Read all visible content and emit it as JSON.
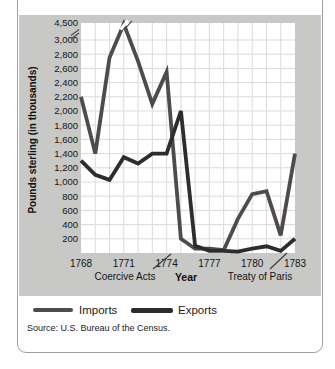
{
  "figure": {
    "source": "Source: U.S. Bureau of the Census.",
    "legend": [
      {
        "label": "Imports",
        "color": "#4f4b4d"
      },
      {
        "label": "Exports",
        "color": "#2f2c2d"
      }
    ]
  },
  "chart_data": {
    "type": "line",
    "title": "",
    "xlabel": "Year",
    "ylabel": "Pounds sterling (in thousands)",
    "x": [
      1768,
      1769,
      1770,
      1771,
      1772,
      1773,
      1774,
      1775,
      1776,
      1777,
      1778,
      1779,
      1780,
      1781,
      1782,
      1783
    ],
    "x_tick_labels": [
      "1768",
      "1771",
      "1774",
      "1777",
      "1780",
      "1783"
    ],
    "y_tick_labels": [
      "4,500",
      "3,000",
      "2,800",
      "2,600",
      "2,400",
      "2,200",
      "2,000",
      "1,800",
      "1,600",
      "1,400",
      "1,200",
      "1,000",
      "800",
      "600",
      "400",
      "200"
    ],
    "ylim": [
      0,
      4500
    ],
    "grid": true,
    "axis_break": {
      "axis": "y",
      "between": [
        3000,
        4500
      ],
      "note": "scale break between 3,000 and 4,500; peak line clipped with break marks"
    },
    "series": [
      {
        "name": "Imports",
        "color": "#4f4b4d",
        "values": [
          2200,
          1400,
          2750,
          4400,
          2700,
          2100,
          2550,
          200,
          60,
          60,
          40,
          480,
          830,
          870,
          250,
          1400
        ]
      },
      {
        "name": "Exports",
        "color": "#2f2c2d",
        "values": [
          1300,
          1100,
          1030,
          1350,
          1260,
          1400,
          1400,
          2000,
          100,
          30,
          30,
          20,
          60,
          95,
          30,
          200
        ]
      }
    ],
    "annotations": [
      {
        "label": "Coercive Acts",
        "year": 1774
      },
      {
        "label": "Treaty of Paris",
        "year": 1783
      }
    ],
    "legend_position": "bottom"
  }
}
